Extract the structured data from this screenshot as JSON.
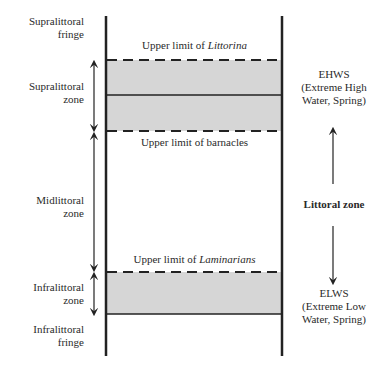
{
  "left_labels": [
    {
      "id": "supralittoral-fringe",
      "line1": "Supralittoral",
      "line2": "fringe"
    },
    {
      "id": "supralittoral-zone",
      "line1": "Supralittoral",
      "line2": "zone"
    },
    {
      "id": "midlittoral-zone",
      "line1": "Midlittoral",
      "line2": "zone"
    },
    {
      "id": "infralittoral-zone",
      "line1": "Infralittoral",
      "line2": "zone"
    },
    {
      "id": "infralittoral-fringe",
      "line1": "Infralittoral",
      "line2": "fringe"
    }
  ],
  "limits": [
    {
      "id": "littorina",
      "prefix": "Upper limit of ",
      "taxon": "Littorina",
      "italic": true
    },
    {
      "id": "barnacles",
      "prefix": "Upper limit of ",
      "taxon": "barnacles",
      "italic": false
    },
    {
      "id": "laminarians",
      "prefix": "Upper limit of ",
      "taxon": "Laminarians",
      "italic": true
    }
  ],
  "right_labels": {
    "ehws": {
      "line1": "EHWS",
      "line2": "(Extreme High",
      "line3": "Water, Spring)"
    },
    "littoral_zone": "Littoral zone",
    "elws": {
      "line1": "ELWS",
      "line2": "(Extreme Low",
      "line3": "Water, Spring)"
    }
  },
  "colors": {
    "band_fill": "#d6d6d6",
    "line": "#222222"
  }
}
